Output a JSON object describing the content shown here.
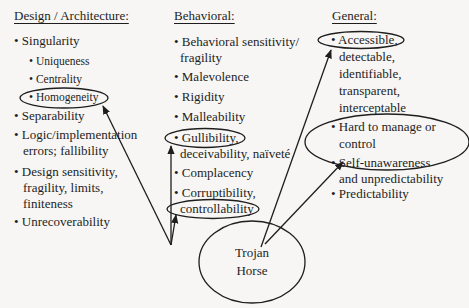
{
  "diagram": {
    "columns": {
      "design": {
        "header": "Design / Architecture:",
        "items": [
          {
            "text": "• Singularity"
          },
          {
            "text": "• Uniqueness",
            "level": 2
          },
          {
            "text": "• Centrality",
            "level": 2
          },
          {
            "text": "• Homogeneity",
            "level": 2,
            "circled": true
          },
          {
            "text": "• Separability"
          },
          {
            "lines": [
              "• Logic/implementation",
              "errors; fallibility"
            ]
          },
          {
            "lines": [
              "• Design sensitivity,",
              "fragility, limits,",
              "finiteness"
            ]
          },
          {
            "text": "• Unrecoverability"
          }
        ]
      },
      "behavioral": {
        "header": "Behavioral:",
        "items": [
          {
            "lines": [
              "• Behavioral sensitivity/",
              "fragility"
            ]
          },
          {
            "text": "• Malevolence"
          },
          {
            "text": "• Rigidity"
          },
          {
            "text": "• Malleability"
          },
          {
            "lines": [
              "• Gullibility,",
              "deceivability, naïveté"
            ],
            "circled_line": 0
          },
          {
            "text": "• Complacency"
          },
          {
            "lines": [
              "• Corruptibility,",
              "controllability"
            ],
            "circled_line": 1
          }
        ]
      },
      "general": {
        "header": "General:",
        "items": [
          {
            "lines": [
              "• Accessible,",
              "detectable,",
              "identifiable,",
              "transparent,",
              "interceptable"
            ],
            "circled_line": 0
          },
          {
            "lines": [
              "• Hard to manage or",
              "control"
            ],
            "circled": true
          },
          {
            "lines": [
              "• Self-unawareness",
              "and unpredictability"
            ]
          },
          {
            "text": "• Predictability"
          }
        ]
      }
    },
    "center_node": {
      "lines": [
        "Trojan",
        "Horse"
      ]
    },
    "arrows": [
      {
        "from": "center_node",
        "to": "Homogeneity"
      },
      {
        "from": "center_node",
        "to": "Gullibility"
      },
      {
        "from": "center_node",
        "to": "controllability"
      },
      {
        "from": "center_node",
        "to": "Accessible"
      },
      {
        "from": "center_node",
        "to": "Hard to manage or control"
      }
    ],
    "colors": {
      "background": "#f7f6f4",
      "ink": "#1e1e1e"
    }
  }
}
